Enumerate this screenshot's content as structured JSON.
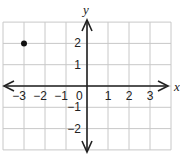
{
  "chart_data": {
    "type": "scatter",
    "title": "",
    "xlabel": "x",
    "ylabel": "y",
    "xlim": [
      -4,
      4
    ],
    "ylim": [
      -3,
      3
    ],
    "grid": true,
    "x_ticks": [
      -3,
      -2,
      -1,
      1,
      2,
      3
    ],
    "y_ticks": [
      2,
      1,
      -1,
      -2
    ],
    "x_tick_labels": [
      "−3",
      "−2",
      "−1",
      "1",
      "2",
      "3"
    ],
    "y_tick_labels": [
      "2",
      "1",
      "−1",
      "−2"
    ],
    "origin_label": "0",
    "points": [
      {
        "x": -3,
        "y": 2
      }
    ],
    "colors": {
      "grid": "#c8c8c8",
      "axis": "#222222",
      "point": "#111111"
    }
  }
}
